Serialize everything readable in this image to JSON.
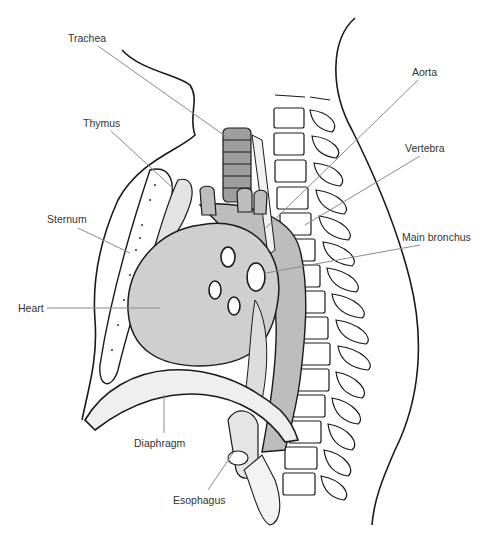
{
  "diagram": {
    "labels": [
      {
        "id": "trachea",
        "text": "Trachea",
        "x": 68,
        "y": 32
      },
      {
        "id": "aorta",
        "text": "Aorta",
        "x": 412,
        "y": 66
      },
      {
        "id": "thymus",
        "text": "Thymus",
        "x": 83,
        "y": 117
      },
      {
        "id": "vertebra",
        "text": "Vertebra",
        "x": 405,
        "y": 142
      },
      {
        "id": "sternum",
        "text": "Sternum",
        "x": 47,
        "y": 213
      },
      {
        "id": "main_bronchus",
        "text": "Main bronchus",
        "x": 402,
        "y": 231
      },
      {
        "id": "heart",
        "text": "Heart",
        "x": 18,
        "y": 302
      },
      {
        "id": "diaphragm",
        "text": "Diaphragm",
        "x": 134,
        "y": 437
      },
      {
        "id": "esophagus",
        "text": "Esophagus",
        "x": 173,
        "y": 494
      }
    ],
    "colors": {
      "line": "#1a1a1a",
      "leader": "#8a8a8a",
      "heart_fill": "#cfcfcf",
      "aorta_fill": "#bdbdbd",
      "trachea_fill": "#9e9e9e",
      "label_text": "#333333"
    }
  }
}
